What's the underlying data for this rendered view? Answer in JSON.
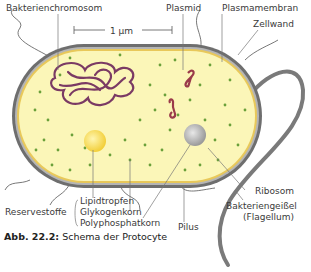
{
  "diagram": {
    "title": "Schema der Protocyte",
    "figure_number": "Abb. 22.2:",
    "scale_bar": "1 µm",
    "labels": {
      "chromosome": "Bakterienchromosom",
      "plasmid": "Plasmid",
      "plasma_membrane": "Plasmamembran",
      "cell_wall": "Zellwand",
      "ribosome": "Ribosom",
      "flagellum": "Bakteriengeißel",
      "flagellum_latin": "(Flagellum)",
      "pilus": "Pilus",
      "reserve_group": "Reservestoffe",
      "lipid": "Lipidtropfen",
      "glycogen": "Glykogenkorn",
      "polyphosphate": "Polyphosphatkorn"
    },
    "colors": {
      "cytoplasm": "#fbf6b8",
      "membrane_inner": "#e8c85a",
      "cell_wall": "#6e6e6e",
      "chromosome": "#7a3a64",
      "ribosome": "#6aa03a",
      "lipid": "#f5d84a",
      "polyphosphate": "#b8b8b8"
    }
  }
}
